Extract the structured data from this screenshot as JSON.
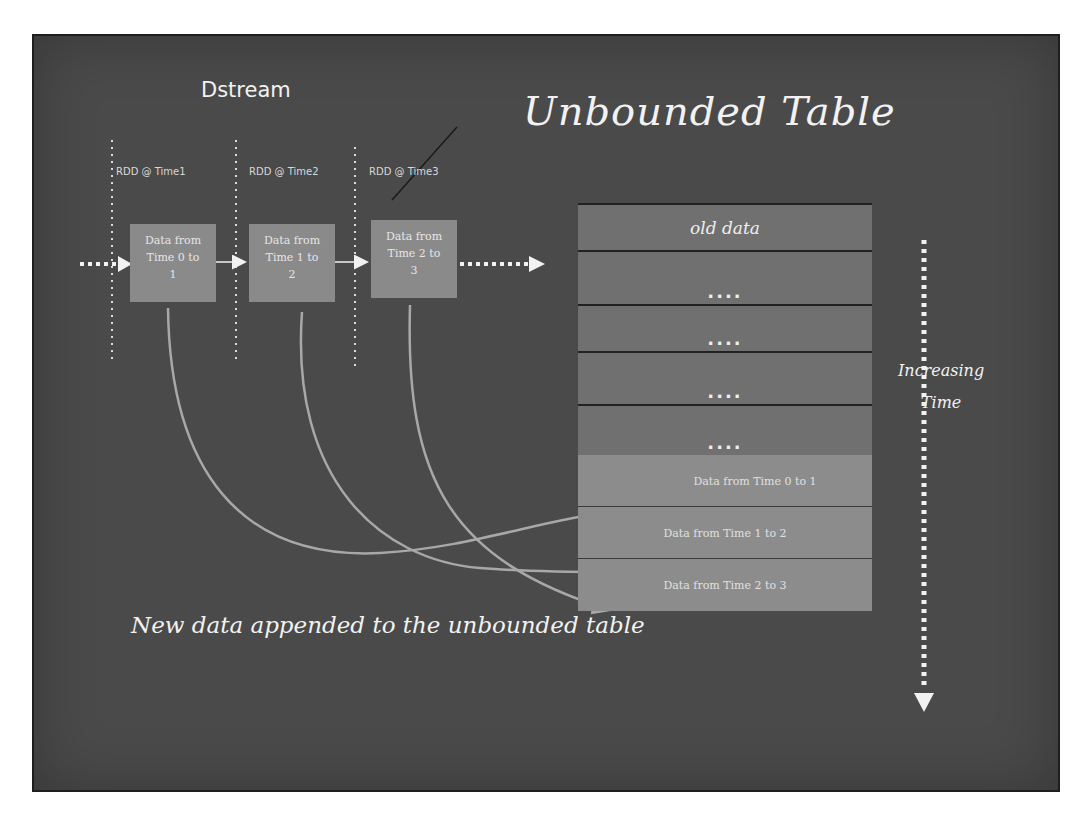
{
  "diagram": {
    "title": "Unbounded Table",
    "dstream_label": "Dstream",
    "rdds": [
      {
        "label": "RDD @ Time1",
        "box_text_line1": "Data from",
        "box_text_line2": "Time 0 to",
        "box_text_line3": "1"
      },
      {
        "label": "RDD @ Time2",
        "box_text_line1": "Data from",
        "box_text_line2": "Time 1 to",
        "box_text_line3": "2"
      },
      {
        "label": "RDD @ Time3",
        "box_text_line1": "Data from",
        "box_text_line2": "Time 2 to",
        "box_text_line3": "3"
      }
    ],
    "table": {
      "old_row": "old data",
      "ellipsis_rows": [
        "....",
        "....",
        "....",
        "...."
      ],
      "new_rows": [
        "Data from Time 0 to 1",
        "Data from Time 1 to 2",
        "Data from Time 2 to 3"
      ]
    },
    "time_axis_label_line1": "Increasing",
    "time_axis_label_line2": "Time",
    "caption": "New data appended to the unbounded table",
    "colors": {
      "board": "#4a4a4a",
      "chalk": "#f2f2f2",
      "rdd_box": "#8a8a8a",
      "table_old_rows": "#707070",
      "table_new_rows": "#8c8c8c",
      "row_divider": "#222222"
    }
  }
}
